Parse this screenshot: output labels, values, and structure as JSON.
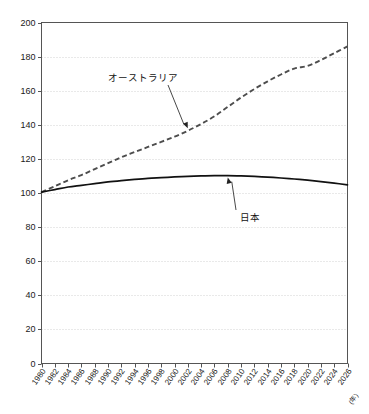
{
  "chart_data": {
    "type": "line",
    "title": "",
    "xlabel": "(年)",
    "ylabel": "",
    "xlim": [
      1980,
      2026
    ],
    "ylim": [
      0,
      200
    ],
    "ytick_step": 20,
    "xtick_step": 2,
    "grid": true,
    "legend_position": "inline-annotations",
    "yticks": [
      0,
      20,
      40,
      60,
      80,
      100,
      120,
      140,
      160,
      180,
      200
    ],
    "xticks": [
      "1980",
      "1982",
      "1984",
      "1986",
      "1988",
      "1990",
      "1992",
      "1994",
      "1996",
      "1998",
      "2000",
      "2002",
      "2004",
      "2006",
      "2008",
      "2010",
      "2012",
      "2014",
      "2016",
      "2018",
      "2020",
      "2022",
      "2024",
      "2026"
    ],
    "x": [
      1980,
      1982,
      1984,
      1986,
      1988,
      1990,
      1992,
      1994,
      1996,
      1998,
      2000,
      2002,
      2004,
      2006,
      2008,
      2010,
      2012,
      2014,
      2016,
      2018,
      2020,
      2022,
      2024,
      2026
    ],
    "series": [
      {
        "name": "オーストラリア",
        "style": "dashed",
        "color": "#4d4d4d",
        "values": [
          100.5,
          104.0,
          107.5,
          110.5,
          114.0,
          117.5,
          121.0,
          124.0,
          127.0,
          130.0,
          133.0,
          136.5,
          140.5,
          145.0,
          150.5,
          156.0,
          161.0,
          165.5,
          169.5,
          173.0,
          174.5,
          178.0,
          182.0,
          186.0
        ]
      },
      {
        "name": "日本",
        "style": "solid",
        "color": "#111111",
        "values": [
          100.5,
          102.0,
          103.5,
          104.5,
          105.5,
          106.5,
          107.3,
          108.0,
          108.6,
          109.0,
          109.4,
          109.7,
          110.0,
          110.2,
          110.2,
          110.0,
          109.7,
          109.3,
          108.8,
          108.2,
          107.5,
          106.7,
          105.8,
          104.8
        ]
      }
    ],
    "annotations": [
      {
        "text": "オーストラリア",
        "target_year": 2002,
        "target_value": 138.0
      },
      {
        "text": "日本",
        "target_year": 2008,
        "target_value": 110.2
      }
    ]
  }
}
